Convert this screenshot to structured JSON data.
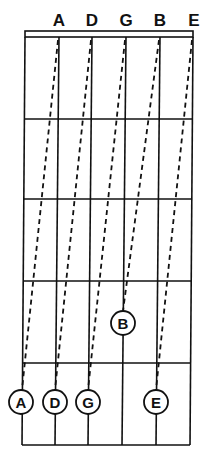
{
  "title_partial": "",
  "string_labels": [
    "A",
    "D",
    "G",
    "B",
    "E"
  ],
  "colors": {
    "ink": "#111111",
    "background": "#ffffff"
  },
  "fretboard": {
    "strings": 6,
    "frets_shown": 5,
    "nut": true
  },
  "notes": [
    {
      "label": "A",
      "string": 1,
      "fret": 5,
      "from_open_string": 2
    },
    {
      "label": "D",
      "string": 2,
      "fret": 5,
      "from_open_string": 3
    },
    {
      "label": "G",
      "string": 3,
      "fret": 5,
      "from_open_string": 4
    },
    {
      "label": "B",
      "string": 4,
      "fret": 4,
      "from_open_string": 5
    },
    {
      "label": "E",
      "string": 5,
      "fret": 5,
      "from_open_string": 6
    }
  ]
}
